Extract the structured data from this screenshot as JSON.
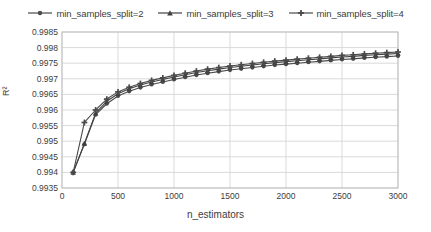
{
  "chart_data": {
    "type": "line",
    "title": "",
    "xlabel": "n_estimators",
    "ylabel": "R²",
    "xlim": [
      0,
      3000
    ],
    "ylim": [
      0.9935,
      0.9985
    ],
    "grid": true,
    "legend_position": "top",
    "xticks": [
      0,
      500,
      1000,
      1500,
      2000,
      2500,
      3000
    ],
    "xtick_labels": [
      "0",
      "500",
      "1000",
      "1500",
      "2000",
      "2500",
      "3000"
    ],
    "yticks": [
      0.9985,
      0.998,
      0.9975,
      0.997,
      0.9965,
      0.996,
      0.9955,
      0.995,
      0.9945,
      0.994,
      0.9935
    ],
    "ytick_labels": [
      "0.9985",
      "0.998",
      "0.9975",
      "0.997",
      "0.9965",
      "0.996",
      "0.9955",
      "0.995",
      "0.9945",
      "0.994",
      "0.9935"
    ],
    "x": [
      100,
      200,
      300,
      400,
      500,
      600,
      700,
      800,
      900,
      1000,
      1100,
      1200,
      1300,
      1400,
      1500,
      1600,
      1700,
      1800,
      1900,
      2000,
      2100,
      2200,
      2300,
      2400,
      2500,
      2600,
      2700,
      2800,
      2900,
      3000
    ],
    "series": [
      {
        "name": "min_samples_split=2",
        "marker": "circle",
        "color": "#4a4a4a",
        "values": [
          0.994,
          0.9949,
          0.99585,
          0.9962,
          0.99645,
          0.9966,
          0.99672,
          0.99682,
          0.9969,
          0.99698,
          0.99705,
          0.99712,
          0.99718,
          0.99723,
          0.99728,
          0.99732,
          0.99736,
          0.9974,
          0.99744,
          0.99747,
          0.9975,
          0.99753,
          0.99756,
          0.99759,
          0.99762,
          0.99764,
          0.99767,
          0.99769,
          0.99771,
          0.99773
        ]
      },
      {
        "name": "min_samples_split=3",
        "marker": "triangle",
        "color": "#404040",
        "values": [
          0.994,
          0.99493,
          0.9959,
          0.99628,
          0.99652,
          0.99668,
          0.9968,
          0.9969,
          0.99698,
          0.99706,
          0.99713,
          0.9972,
          0.99726,
          0.99731,
          0.99736,
          0.9974,
          0.99744,
          0.99748,
          0.99752,
          0.99755,
          0.99758,
          0.99761,
          0.99764,
          0.99767,
          0.9977,
          0.99772,
          0.99775,
          0.99777,
          0.99779,
          0.99781
        ]
      },
      {
        "name": "min_samples_split=4",
        "marker": "plus",
        "color": "#4a4a4a",
        "values": [
          0.994,
          0.9956,
          0.996,
          0.99635,
          0.99658,
          0.99673,
          0.99685,
          0.99695,
          0.99703,
          0.99711,
          0.99718,
          0.99725,
          0.99731,
          0.99736,
          0.99741,
          0.99745,
          0.99749,
          0.99753,
          0.99757,
          0.9976,
          0.99763,
          0.99766,
          0.99769,
          0.99772,
          0.99775,
          0.99777,
          0.9978,
          0.99782,
          0.99784,
          0.99786
        ]
      }
    ],
    "style": {
      "plot_background": "#ffffff",
      "grid_color": "#d9d9d9",
      "axis_color": "#bfbfbf",
      "text_color": "#3c3c3c",
      "line_color": "#4a4a4a"
    },
    "plot_box": {
      "left": 62,
      "top": 32,
      "right": 398,
      "bottom": 188
    }
  }
}
